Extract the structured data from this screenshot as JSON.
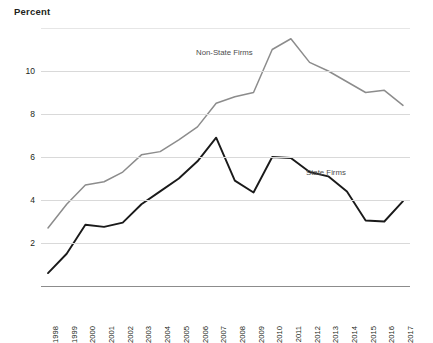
{
  "chart_data": {
    "type": "line",
    "title": "",
    "ylabel": "Percent",
    "xlabel": "",
    "ylim": [
      0,
      12
    ],
    "yticks": [
      2,
      4,
      6,
      8,
      10
    ],
    "grid": true,
    "legend_position": "inline-annotation",
    "categories": [
      "1998",
      "1999",
      "2000",
      "2001",
      "2002",
      "2003",
      "2004",
      "2005",
      "2006",
      "2007",
      "2008",
      "2009",
      "2010",
      "2011",
      "2012",
      "2013",
      "2014",
      "2015",
      "2016",
      "2017"
    ],
    "series": [
      {
        "name": "Non-State Firms",
        "color": "#8c8c8c",
        "values": [
          2.7,
          3.8,
          4.7,
          4.85,
          5.3,
          6.1,
          6.25,
          6.8,
          7.4,
          8.5,
          8.8,
          9.0,
          11.0,
          11.5,
          10.4,
          10.0,
          9.5,
          9.0,
          9.1,
          8.4
        ]
      },
      {
        "name": "State Firms",
        "color": "#1a1a1a",
        "values": [
          0.6,
          1.5,
          2.85,
          2.75,
          2.95,
          3.8,
          4.4,
          5.0,
          5.8,
          6.9,
          4.9,
          4.35,
          6.0,
          5.95,
          5.3,
          5.1,
          4.4,
          3.05,
          3.0,
          3.95
        ]
      }
    ],
    "annotations": [
      {
        "text": "Non-State Firms",
        "series": "Non-State Firms"
      },
      {
        "text": "State Firms",
        "series": "State Firms"
      }
    ]
  },
  "colors": {
    "gridline": "#d9d9d9",
    "axis": "#8c8c8c",
    "text": "#231f20",
    "annotation": "#4d4d4d",
    "background": "#ffffff"
  }
}
